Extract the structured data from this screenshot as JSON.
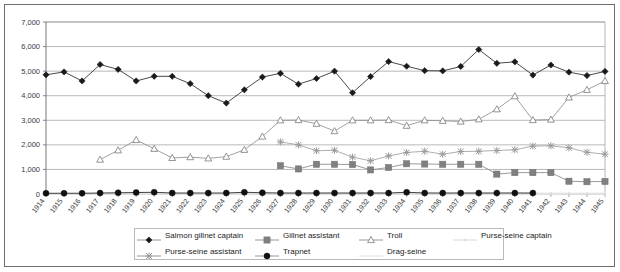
{
  "chart_data": {
    "type": "line",
    "title": "",
    "subtitle": "",
    "xlabel": "",
    "ylabel": "",
    "ylim": [
      0,
      7000
    ],
    "ytick_step": 1000,
    "yticks": [
      "0",
      "1,000",
      "2,000",
      "3,000",
      "4,000",
      "5,000",
      "6,000",
      "7,000"
    ],
    "grid": true,
    "legend_position": "bottom",
    "categories": [
      "1914",
      "1915",
      "1916",
      "1917",
      "1918",
      "1919",
      "1920",
      "1921",
      "1922",
      "1923",
      "1924",
      "1925",
      "1926",
      "1927",
      "1928",
      "1929",
      "1930",
      "1931",
      "1932",
      "1933",
      "1934",
      "1935",
      "1936",
      "1937",
      "1938",
      "1939",
      "1940",
      "1941",
      "1942",
      "1943",
      "1944",
      "1945"
    ],
    "series": [
      {
        "name": "Salmon gillnet captain",
        "marker": "diamond",
        "color": "#1a1a1a",
        "values": [
          4850,
          4970,
          4600,
          5270,
          5070,
          4600,
          4790,
          4790,
          4490,
          4000,
          3700,
          4240,
          4760,
          4910,
          4470,
          4700,
          5000,
          4120,
          4780,
          5390,
          5200,
          5020,
          5010,
          5190,
          5880,
          5320,
          5380,
          4840,
          5250,
          4960,
          4820,
          4990
        ]
      },
      {
        "name": "Gillnet assistant",
        "marker": "square",
        "color": "#808080",
        "values": [
          null,
          null,
          null,
          null,
          null,
          null,
          null,
          null,
          null,
          null,
          null,
          null,
          null,
          1150,
          1020,
          1210,
          1210,
          1200,
          980,
          1080,
          1230,
          1220,
          1210,
          1210,
          1210,
          810,
          870,
          870,
          870,
          520,
          500,
          510
        ]
      },
      {
        "name": "Troll",
        "marker": "triangle-open",
        "color": "#8a8a8a",
        "values": [
          null,
          null,
          null,
          1400,
          1780,
          2200,
          1840,
          1470,
          1500,
          1450,
          1520,
          1800,
          2340,
          3000,
          3010,
          2860,
          2560,
          3000,
          3000,
          3010,
          2780,
          3000,
          2980,
          2950,
          3040,
          3450,
          3980,
          3010,
          3030,
          3930,
          4240,
          4600
        ]
      },
      {
        "name": "Purse-seine captain",
        "marker": "dot-faint",
        "color": "#e2e2e2",
        "values": [
          20,
          20,
          20,
          20,
          25,
          30,
          35,
          30,
          25,
          25,
          25,
          30,
          35,
          35,
          35,
          35,
          35,
          35,
          35,
          35,
          40,
          40,
          40,
          40,
          40,
          40,
          40,
          40,
          40,
          40,
          40,
          40
        ]
      },
      {
        "name": "Purse-seine assistant",
        "marker": "cross",
        "color": "#999999",
        "values": [
          null,
          null,
          null,
          null,
          null,
          null,
          null,
          null,
          null,
          null,
          null,
          null,
          null,
          2120,
          2000,
          1760,
          1780,
          1500,
          1350,
          1550,
          1690,
          1740,
          1620,
          1730,
          1740,
          1770,
          1800,
          1950,
          1960,
          1880,
          1700,
          1620
        ]
      },
      {
        "name": "Trapnet",
        "marker": "circle",
        "color": "#111111",
        "values": [
          30,
          30,
          30,
          40,
          50,
          60,
          70,
          40,
          40,
          40,
          40,
          70,
          50,
          40,
          40,
          40,
          40,
          40,
          40,
          40,
          70,
          40,
          40,
          40,
          40,
          40,
          40,
          40,
          null,
          null,
          null,
          null
        ]
      },
      {
        "name": "Drag-seine",
        "marker": "line-faint",
        "color": "#ededed",
        "values": [
          10,
          10,
          10,
          10,
          10,
          10,
          10,
          10,
          10,
          10,
          10,
          10,
          10,
          10,
          10,
          10,
          10,
          10,
          10,
          10,
          10,
          10,
          10,
          10,
          10,
          10,
          10,
          10,
          10,
          10,
          10,
          10
        ]
      }
    ],
    "legend_entries": [
      {
        "label": "Salmon gillnet captain",
        "marker": "diamond",
        "color": "#1a1a1a"
      },
      {
        "label": "Gillnet assistant",
        "marker": "square",
        "color": "#808080"
      },
      {
        "label": "Troll",
        "marker": "triangle-open",
        "color": "#8a8a8a"
      },
      {
        "label": "Purse-seine captain",
        "marker": "dot-faint",
        "color": "#d8d8d8"
      },
      {
        "label": "Purse-seine assistant",
        "marker": "cross",
        "color": "#999999"
      },
      {
        "label": "Trapnet",
        "marker": "circle",
        "color": "#111111"
      },
      {
        "label": "Drag-seine",
        "marker": "line-faint",
        "color": "#e0e0e0"
      }
    ]
  }
}
